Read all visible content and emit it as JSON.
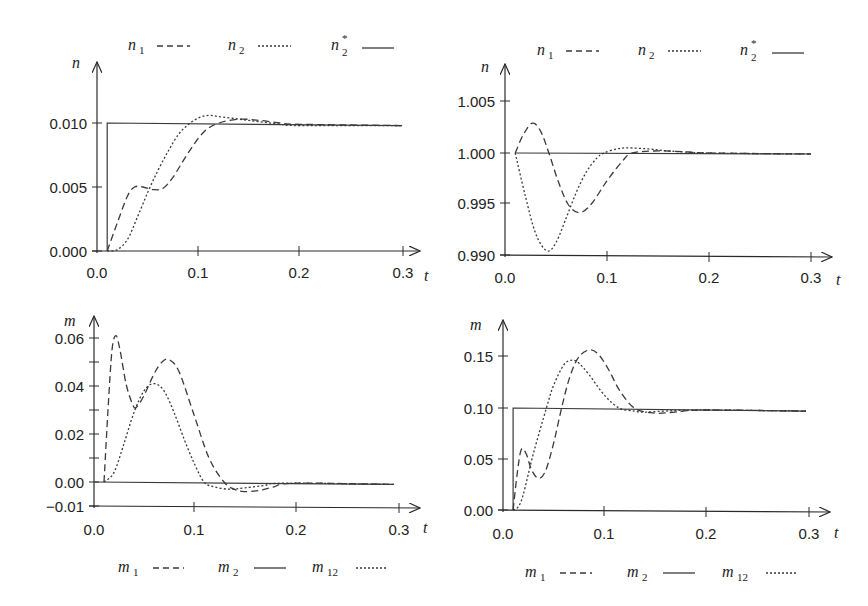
{
  "chart_data": [
    {
      "id": "top-left",
      "type": "line",
      "title": "",
      "xlabel": "t",
      "ylabel": "n",
      "xlim": [
        0,
        0.3
      ],
      "ylim": [
        0,
        0.0125
      ],
      "xticks": [
        0.0,
        0.1,
        0.2,
        0.3
      ],
      "xtick_labels": [
        "0.0",
        "0.1",
        "0.2",
        "0.3"
      ],
      "yticks": [
        0.0,
        0.005,
        0.01
      ],
      "ytick_labels": [
        "0.000",
        "0.005",
        "0.010"
      ],
      "grid": false,
      "legend_position": "top",
      "legend": [
        {
          "name": "n",
          "sub": "1",
          "sup": "",
          "style": "dashed"
        },
        {
          "name": "n",
          "sub": "2",
          "sup": "",
          "style": "dotted"
        },
        {
          "name": "n",
          "sub": "2",
          "sup": "*",
          "style": "solid"
        }
      ],
      "series": [
        {
          "name": "n1",
          "style": "dashed",
          "x": [
            0.01,
            0.02,
            0.03,
            0.037,
            0.045,
            0.055,
            0.065,
            0.075,
            0.09,
            0.105,
            0.12,
            0.14,
            0.16,
            0.18,
            0.2,
            0.3
          ],
          "y": [
            0.0,
            0.0022,
            0.0043,
            0.005,
            0.005,
            0.0048,
            0.0049,
            0.0058,
            0.0077,
            0.0093,
            0.01,
            0.0103,
            0.0102,
            0.01,
            0.0099,
            0.0098
          ]
        },
        {
          "name": "n2",
          "style": "dotted",
          "x": [
            0.01,
            0.02,
            0.03,
            0.04,
            0.05,
            0.06,
            0.07,
            0.08,
            0.09,
            0.1,
            0.11,
            0.12,
            0.14,
            0.16,
            0.18,
            0.2,
            0.3
          ],
          "y": [
            0.0,
            0.0001,
            0.0009,
            0.0027,
            0.0046,
            0.0063,
            0.0078,
            0.0091,
            0.0099,
            0.0104,
            0.0106,
            0.0105,
            0.0103,
            0.0101,
            0.0099,
            0.0098,
            0.0098
          ]
        },
        {
          "name": "n2*",
          "style": "solid",
          "x": [
            0.01,
            0.01,
            0.3
          ],
          "y": [
            0.0,
            0.01,
            0.0098
          ]
        }
      ]
    },
    {
      "id": "top-right",
      "type": "line",
      "title": "",
      "xlabel": "t",
      "ylabel": "n",
      "xlim": [
        0,
        0.3
      ],
      "ylim": [
        0.99,
        1.0075
      ],
      "xticks": [
        0.0,
        0.1,
        0.2,
        0.3
      ],
      "xtick_labels": [
        "0.0",
        "0.1",
        "0.2",
        "0.3"
      ],
      "yticks": [
        0.99,
        0.995,
        1.0,
        1.005
      ],
      "ytick_labels": [
        "0.990",
        "0.995",
        "1.000",
        "1.005"
      ],
      "grid": false,
      "legend_position": "top",
      "legend": [
        {
          "name": "n",
          "sub": "1",
          "sup": "",
          "style": "dashed"
        },
        {
          "name": "n",
          "sub": "2",
          "sup": "",
          "style": "dotted"
        },
        {
          "name": "n",
          "sub": "2",
          "sup": "*",
          "style": "solid"
        }
      ],
      "series": [
        {
          "name": "n1",
          "style": "dashed",
          "x": [
            0.01,
            0.018,
            0.027,
            0.035,
            0.043,
            0.052,
            0.062,
            0.073,
            0.085,
            0.1,
            0.115,
            0.125,
            0.15,
            0.18,
            0.2,
            0.3
          ],
          "y": [
            1.0,
            1.0018,
            1.0029,
            1.0021,
            1.0,
            0.9973,
            0.995,
            0.9942,
            0.9951,
            0.9973,
            0.9992,
            1.0,
            1.0002,
            1.0001,
            1.0,
            0.9999
          ]
        },
        {
          "name": "n2",
          "style": "dotted",
          "x": [
            0.01,
            0.02,
            0.03,
            0.041,
            0.05,
            0.06,
            0.07,
            0.08,
            0.09,
            0.097,
            0.11,
            0.12,
            0.14,
            0.16,
            0.2,
            0.3
          ],
          "y": [
            1.0,
            0.9958,
            0.9922,
            0.9905,
            0.9913,
            0.9937,
            0.9962,
            0.9982,
            0.9995,
            1.0,
            1.0004,
            1.0005,
            1.0004,
            1.0002,
            1.0,
            0.9999
          ]
        },
        {
          "name": "n2*",
          "style": "solid",
          "x": [
            0.01,
            0.3
          ],
          "y": [
            1.0,
            0.9999
          ]
        }
      ]
    },
    {
      "id": "bottom-left",
      "type": "line",
      "title": "",
      "xlabel": "t",
      "ylabel": "m",
      "xlim": [
        0,
        0.3
      ],
      "ylim": [
        -0.01,
        0.0675
      ],
      "xticks": [
        0.0,
        0.1,
        0.2,
        0.3
      ],
      "xtick_labels": [
        "0.0",
        "0.1",
        "0.2",
        "0.3"
      ],
      "yticks": [
        -0.01,
        0.0,
        0.01,
        0.02,
        0.03,
        0.04,
        0.05,
        0.06
      ],
      "ytick_labels": [
        "−0.01",
        "0.00",
        "",
        "0.02",
        "",
        "0.04",
        "",
        "0.06"
      ],
      "grid": false,
      "legend_position": "bottom",
      "legend": [
        {
          "name": "m",
          "sub": "1",
          "sup": "",
          "style": "dashed"
        },
        {
          "name": "m",
          "sub": "2",
          "sup": "",
          "style": "solid"
        },
        {
          "name": "m",
          "sub": "12",
          "sup": "",
          "style": "dotted"
        }
      ],
      "series": [
        {
          "name": "m1",
          "style": "dashed",
          "x": [
            0.01,
            0.014,
            0.018,
            0.022,
            0.026,
            0.032,
            0.038,
            0.042,
            0.05,
            0.06,
            0.068,
            0.075,
            0.085,
            0.1,
            0.115,
            0.13,
            0.14,
            0.15,
            0.165,
            0.18,
            0.2,
            0.3
          ],
          "y": [
            0.0,
            0.03,
            0.055,
            0.061,
            0.055,
            0.041,
            0.033,
            0.031,
            0.036,
            0.045,
            0.05,
            0.051,
            0.046,
            0.028,
            0.01,
            0.0,
            -0.003,
            -0.004,
            -0.0035,
            -0.002,
            -0.0005,
            -0.001
          ]
        },
        {
          "name": "m2",
          "style": "solid",
          "x": [
            0.0,
            0.3
          ],
          "y": [
            0.0,
            -0.001
          ]
        },
        {
          "name": "m12",
          "style": "dotted",
          "x": [
            0.01,
            0.02,
            0.03,
            0.04,
            0.05,
            0.06,
            0.07,
            0.08,
            0.09,
            0.1,
            0.11,
            0.12,
            0.135,
            0.15,
            0.17,
            0.19,
            0.3
          ],
          "y": [
            0.0,
            0.004,
            0.016,
            0.029,
            0.038,
            0.041,
            0.038,
            0.029,
            0.018,
            0.008,
            0.0,
            -0.002,
            -0.003,
            -0.0025,
            -0.0015,
            -0.0005,
            -0.001
          ]
        }
      ]
    },
    {
      "id": "bottom-right",
      "type": "line",
      "title": "",
      "xlabel": "t",
      "ylabel": "m",
      "xlim": [
        0,
        0.3
      ],
      "ylim": [
        0,
        0.19
      ],
      "xticks": [
        0.0,
        0.1,
        0.2,
        0.3
      ],
      "xtick_labels": [
        "0.0",
        "0.1",
        "0.2",
        "0.3"
      ],
      "yticks": [
        0.0,
        0.05,
        0.1,
        0.15
      ],
      "ytick_labels": [
        "0.00",
        "0.05",
        "0.10",
        "0.15"
      ],
      "grid": false,
      "legend_position": "bottom",
      "legend": [
        {
          "name": "m",
          "sub": "1",
          "sup": "",
          "style": "dashed"
        },
        {
          "name": "m",
          "sub": "2",
          "sup": "",
          "style": "solid"
        },
        {
          "name": "m",
          "sub": "12",
          "sup": "",
          "style": "dotted"
        }
      ],
      "series": [
        {
          "name": "m1",
          "style": "dashed",
          "x": [
            0.01,
            0.014,
            0.018,
            0.023,
            0.028,
            0.035,
            0.042,
            0.05,
            0.058,
            0.066,
            0.075,
            0.086,
            0.095,
            0.105,
            0.115,
            0.13,
            0.15,
            0.17,
            0.2,
            0.3
          ],
          "y": [
            0.0,
            0.035,
            0.059,
            0.055,
            0.04,
            0.031,
            0.038,
            0.065,
            0.1,
            0.13,
            0.15,
            0.157,
            0.152,
            0.137,
            0.118,
            0.1,
            0.095,
            0.096,
            0.098,
            0.097
          ]
        },
        {
          "name": "m2",
          "style": "solid",
          "x": [
            0.01,
            0.01,
            0.3
          ],
          "y": [
            0.0,
            0.1,
            0.097
          ]
        },
        {
          "name": "m12",
          "style": "dotted",
          "x": [
            0.01,
            0.015,
            0.02,
            0.03,
            0.043,
            0.05,
            0.06,
            0.068,
            0.075,
            0.085,
            0.1,
            0.115,
            0.13,
            0.14,
            0.16,
            0.2,
            0.3
          ],
          "y": [
            0.0,
            0.003,
            0.015,
            0.055,
            0.1,
            0.122,
            0.142,
            0.147,
            0.144,
            0.133,
            0.113,
            0.1,
            0.097,
            0.096,
            0.097,
            0.098,
            0.097
          ]
        }
      ]
    }
  ],
  "panels": {
    "top_left": {
      "ylabel": "n",
      "xlabel": "t",
      "legend": {
        "l1": "n",
        "l1sub": "1",
        "l2": "n",
        "l2sub": "2",
        "l3": "n",
        "l3sub": "2",
        "l3sup": "*"
      },
      "yticks": [
        "0.000",
        "0.005",
        "0.010"
      ],
      "xticks": [
        "0.0",
        "0.1",
        "0.2",
        "0.3"
      ]
    },
    "top_right": {
      "ylabel": "n",
      "xlabel": "t",
      "legend": {
        "l1": "n",
        "l1sub": "1",
        "l2": "n",
        "l2sub": "2",
        "l3": "n",
        "l3sub": "2",
        "l3sup": "*"
      },
      "yticks": [
        "0.990",
        "0.995",
        "1.000",
        "1.005"
      ],
      "xticks": [
        "0.0",
        "0.1",
        "0.2",
        "0.3"
      ]
    },
    "bottom_left": {
      "ylabel": "m",
      "xlabel": "t",
      "legend": {
        "l1": "m",
        "l1sub": "1",
        "l2": "m",
        "l2sub": "2",
        "l3": "m",
        "l3sub": "12"
      },
      "yticks": [
        "−0.01",
        "0.00",
        "0.02",
        "0.04",
        "0.06"
      ],
      "xticks": [
        "0.0",
        "0.1",
        "0.2",
        "0.3"
      ]
    },
    "bottom_right": {
      "ylabel": "m",
      "xlabel": "t",
      "legend": {
        "l1": "m",
        "l1sub": "1",
        "l2": "m",
        "l2sub": "2",
        "l3": "m",
        "l3sub": "12"
      },
      "yticks": [
        "0.00",
        "0.05",
        "0.10",
        "0.15"
      ],
      "xticks": [
        "0.0",
        "0.1",
        "0.2",
        "0.3"
      ]
    }
  },
  "colors": {
    "line": "#3a3a3a",
    "axis": "#2a2a2a",
    "text": "#222222",
    "background": "#ffffff"
  }
}
